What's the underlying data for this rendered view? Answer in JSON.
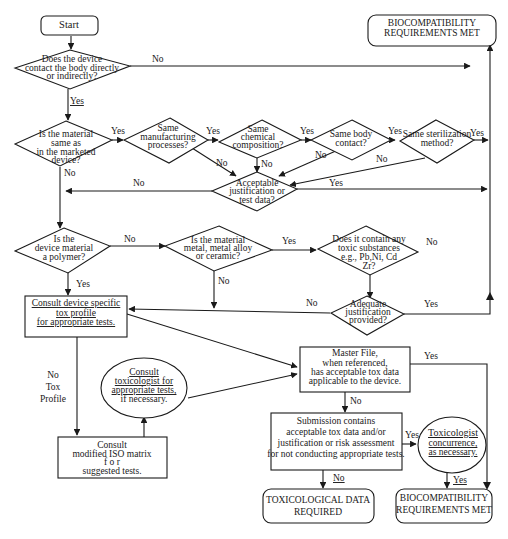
{
  "diagram": {
    "nodes": {
      "start": {
        "label": "Start"
      },
      "contact": {
        "lines": [
          "Does the device",
          "contact the body directly",
          "or indirectly?"
        ]
      },
      "bio_top": {
        "lines": [
          "BIOCOMPATIBILITY",
          "REQUIREMENTS MET"
        ]
      },
      "same_material": {
        "lines": [
          "Is the material",
          "same as",
          "in the marketed",
          "device?"
        ]
      },
      "same_mfg": {
        "lines": [
          "Same",
          "manufacturing",
          "processes?"
        ]
      },
      "same_chem": {
        "lines": [
          "Same",
          "chemical",
          "composition?"
        ]
      },
      "same_body": {
        "lines": [
          "Same body",
          "contact?"
        ]
      },
      "same_steril": {
        "lines": [
          "Same sterilization",
          "method?"
        ]
      },
      "acceptable_just": {
        "lines": [
          "Acceptable",
          "justification or",
          "test data?"
        ]
      },
      "polymer": {
        "lines": [
          "Is the",
          "device material",
          "a polymer?"
        ]
      },
      "metal": {
        "lines": [
          "Is the material",
          "metal, metal alloy",
          "or ceramic?"
        ]
      },
      "toxic": {
        "lines": [
          "Does it contain any",
          "toxic substances",
          "e.g., Pb,Ni, Cd",
          "Zr?"
        ]
      },
      "adequate_just": {
        "lines": [
          "Adequate",
          "justification",
          "provided?"
        ]
      },
      "consult_profile": {
        "lines": [
          "Consult device specific",
          "tox profile",
          "for appropriate tests."
        ]
      },
      "consult_tox": {
        "lines": [
          "Consult",
          "toxicologist for",
          "appropriate tests,",
          "if necessary."
        ]
      },
      "consult_iso": {
        "lines": [
          "Consult",
          "modified ISO matrix",
          "f o r",
          "suggested tests."
        ]
      },
      "master_file": {
        "lines": [
          "Master File,",
          "when referenced,",
          "has acceptable tox data",
          "applicable to the device."
        ]
      },
      "submission": {
        "lines": [
          "Submission contains",
          "acceptable tox data and/or",
          "justification or risk assessment",
          "for not conducting appropriate tests."
        ]
      },
      "tox_concurrence": {
        "lines": [
          "Toxicologist",
          "concurrence,",
          "as necessary."
        ]
      },
      "tox_required": {
        "lines": [
          "TOXICOLOGICAL DATA",
          "REQUIRED"
        ]
      },
      "bio_bottom": {
        "lines": [
          "BIOCOMPATIBILITY",
          "REQUIREMENTS MET"
        ]
      }
    },
    "edge_labels": {
      "yes": "Yes",
      "no": "No",
      "no_tox_profile": [
        "No",
        "Tox",
        "Profile"
      ]
    }
  }
}
